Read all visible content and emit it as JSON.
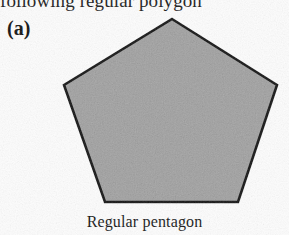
{
  "page": {
    "width": 289,
    "height": 235,
    "background_color": "#fdfdfd",
    "clipped_header_text": "following regular polygon"
  },
  "figure": {
    "label": "(a)",
    "caption": "Regular pentagon",
    "shape_name": "pentagon-shape",
    "sides": 5,
    "fill_color": "#a8a8a8",
    "stroke_color": "#171717",
    "stroke_width": 2.6,
    "vertices": [
      [
        172,
        19
      ],
      [
        277,
        85
      ],
      [
        238,
        202
      ],
      [
        105,
        202
      ],
      [
        64,
        85
      ]
    ],
    "points_attr": "172,19 277,85 238,202 105,202 64,85"
  }
}
